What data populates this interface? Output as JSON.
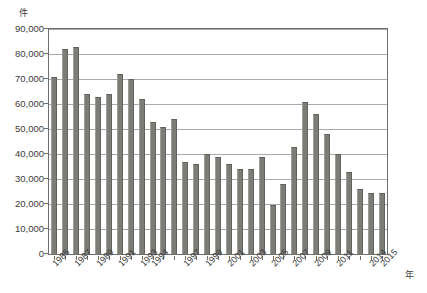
{
  "chart_data": {
    "type": "bar",
    "title": "",
    "subtitle": "",
    "xlabel": "年",
    "ylabel": "件",
    "ylim": [
      0,
      90000
    ],
    "ytick_step": 10000,
    "grid": true,
    "legend": false,
    "bar_color": "#7d7d77",
    "axis_color": "#6f6f6f",
    "grid_color": "#a9a9a9",
    "ytick_labels": [
      "90,000",
      "80,000",
      "70,000",
      "60,000",
      "50,000",
      "40,000",
      "30,000",
      "20,000",
      "10,000",
      "0"
    ],
    "ytick_values": [
      90000,
      80000,
      70000,
      60000,
      50000,
      40000,
      30000,
      20000,
      10000,
      0
    ],
    "xtick_labels": [
      "1985",
      "1987",
      "1989",
      "1991",
      "1993",
      "1994",
      "1997",
      "1999",
      "2001",
      "2003",
      "2005",
      "2007",
      "2009",
      "2011",
      "2014",
      "2015"
    ],
    "categories": [
      "1985",
      "1986",
      "1987",
      "1988",
      "1989",
      "1990",
      "1991",
      "1992",
      "1993",
      "1994",
      "1995",
      "1996",
      "1997",
      "1998",
      "1999",
      "2000",
      "2001",
      "2002",
      "2003",
      "2004",
      "2005",
      "2006",
      "2007",
      "2008",
      "2009",
      "2010",
      "2011",
      "2012",
      "2013",
      "2014",
      "2015"
    ],
    "values": [
      71000,
      82000,
      83000,
      64000,
      63000,
      64000,
      72000,
      70000,
      62000,
      53000,
      51000,
      54000,
      37000,
      36000,
      40000,
      39000,
      36000,
      34000,
      34000,
      39000,
      19500,
      28000,
      43000,
      61000,
      56000,
      48000,
      40000,
      33000,
      26000,
      24500,
      24500
    ],
    "series": [
      {
        "name": "件数",
        "values": [
          71000,
          82000,
          83000,
          64000,
          63000,
          64000,
          72000,
          70000,
          62000,
          53000,
          51000,
          54000,
          37000,
          36000,
          40000,
          39000,
          36000,
          34000,
          34000,
          39000,
          19500,
          28000,
          43000,
          61000,
          56000,
          48000,
          40000,
          33000,
          26000,
          24500,
          24500
        ]
      }
    ]
  }
}
